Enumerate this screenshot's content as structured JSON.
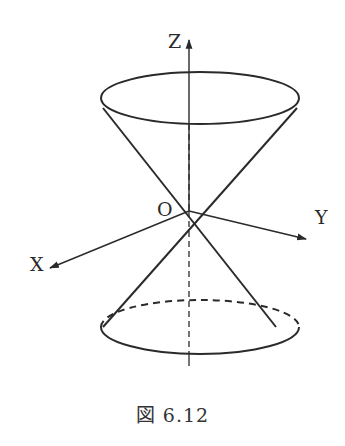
{
  "figure": {
    "caption": "図 6.12"
  },
  "labels": {
    "z_axis": "Z",
    "x_axis": "X",
    "y_axis": "Y",
    "origin": "O"
  },
  "colors": {
    "stroke": "#2a2a2a",
    "background": "#ffffff"
  }
}
